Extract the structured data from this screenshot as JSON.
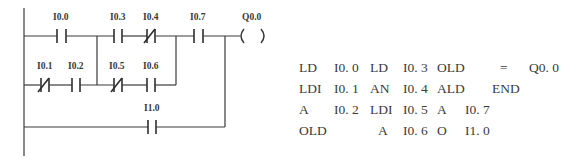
{
  "ladder": {
    "contacts": [
      {
        "id": "I0.0",
        "label": "I0.0",
        "type": "NO",
        "rung": 1
      },
      {
        "id": "I0.3",
        "label": "I0.3",
        "type": "NO",
        "rung": 1
      },
      {
        "id": "I0.4",
        "label": "I0.4",
        "type": "NC",
        "rung": 1
      },
      {
        "id": "I0.7",
        "label": "I0.7",
        "type": "NO",
        "rung": 1
      },
      {
        "id": "I0.1",
        "label": "I0.1",
        "type": "NC",
        "rung": 2
      },
      {
        "id": "I0.2",
        "label": "I0.2",
        "type": "NO",
        "rung": 2
      },
      {
        "id": "I0.5",
        "label": "I0.5",
        "type": "NC",
        "rung": 2
      },
      {
        "id": "I0.6",
        "label": "I0.6",
        "type": "NO",
        "rung": 2
      },
      {
        "id": "I1.0",
        "label": "I1.0",
        "type": "NO",
        "rung": 3
      }
    ],
    "coil": {
      "label": "Q0.0",
      "symbol": "(   )"
    }
  },
  "instruction_list": {
    "rows": [
      [
        {
          "op": "LD",
          "arg": "I0. 0"
        },
        {
          "op": "LD",
          "arg": "I0. 3"
        },
        {
          "op": "OLD",
          "arg": ""
        },
        {
          "op": "=",
          "arg": "Q0. 0"
        }
      ],
      [
        {
          "op": "LDI",
          "arg": "I0. 1"
        },
        {
          "op": "AN",
          "arg": "I0. 4"
        },
        {
          "op": "ALD",
          "arg": ""
        },
        {
          "op": "END",
          "arg": ""
        }
      ],
      [
        {
          "op": "A",
          "arg": "I0. 2"
        },
        {
          "op": "LDI",
          "arg": "I0. 5"
        },
        {
          "op": "A",
          "arg": "I0. 7"
        },
        {
          "op": "",
          "arg": ""
        }
      ],
      [
        {
          "op": "OLD",
          "arg": ""
        },
        {
          "op": "A",
          "arg": "I0. 6"
        },
        {
          "op": "O",
          "arg": "I1. 0"
        },
        {
          "op": "",
          "arg": ""
        }
      ]
    ]
  }
}
